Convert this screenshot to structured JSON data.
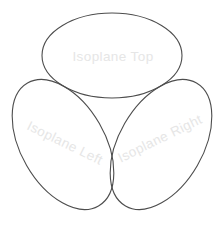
{
  "diagram": {
    "background_color": "#ffffff",
    "outline_color": "#4d4d4d",
    "label_color": "#e6e6e6",
    "planes": [
      {
        "id": "top",
        "label": "Isoplane Top"
      },
      {
        "id": "left",
        "label": "Isoplane Left"
      },
      {
        "id": "right",
        "label": "Isoplane Right"
      }
    ]
  }
}
